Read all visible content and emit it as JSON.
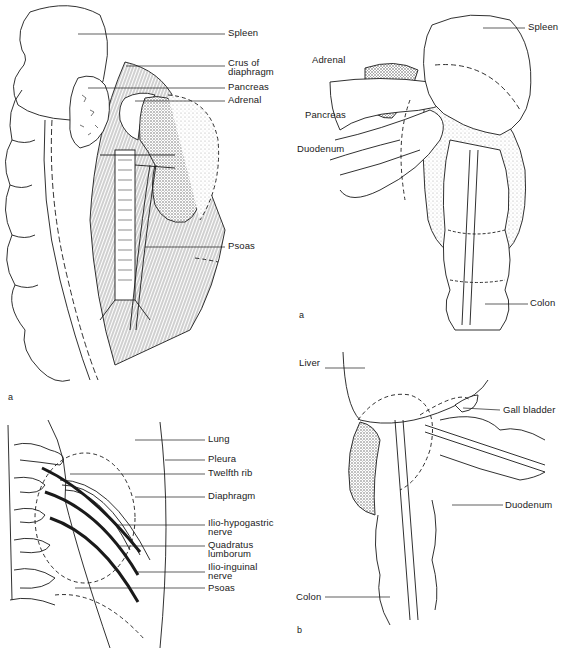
{
  "figure": {
    "panels": [
      {
        "id": "top-left",
        "panel_letter": "a",
        "subject": "Left kidney with posterior relations",
        "labels": [
          "Spleen",
          "Crus of diaphragm",
          "Pancreas",
          "Adrenal",
          "Psoas"
        ]
      },
      {
        "id": "top-right",
        "panel_letter": "a",
        "subject": "Left kidney anterior relations",
        "labels": [
          "Spleen",
          "Adrenal",
          "Pancreas",
          "Duodenum",
          "Colon"
        ]
      },
      {
        "id": "bottom-left",
        "panel_letter": "",
        "subject": "Posterior relations of kidney - ribs and nerves",
        "labels": [
          "Lung",
          "Pleura",
          "Twelfth rib",
          "Diaphragm",
          "Ilio-hypogastric nerve",
          "Quadratus lumborum",
          "Ilio-inguinal nerve",
          "Psoas"
        ]
      },
      {
        "id": "bottom-right",
        "panel_letter": "b",
        "subject": "Right kidney anterior relations",
        "labels": [
          "Liver",
          "Gall bladder",
          "Duodenum",
          "Colon"
        ]
      }
    ]
  },
  "tl": {
    "spleen": "Spleen",
    "crus_1": "Crus of",
    "crus_2": "diaphragm",
    "pancreas": "Pancreas",
    "adrenal": "Adrenal",
    "psoas": "Psoas",
    "letter": "a"
  },
  "tr": {
    "spleen": "Spleen",
    "adrenal": "Adrenal",
    "pancreas": "Pancreas",
    "duodenum": "Duodenum",
    "colon": "Colon",
    "letter": "a"
  },
  "bl": {
    "lung": "Lung",
    "pleura": "Pleura",
    "twelfth_rib": "Twelfth rib",
    "diaphragm": "Diaphragm",
    "ilio_hypo_1": "Ilio-hypogastric",
    "ilio_hypo_2": "nerve",
    "quad_1": "Quadratus",
    "quad_2": "lumborum",
    "ilio_ing_1": "Ilio-inguinal",
    "ilio_ing_2": "nerve",
    "psoas": "Psoas"
  },
  "br": {
    "liver": "Liver",
    "gall_bladder": "Gall bladder",
    "duodenum": "Duodenum",
    "colon": "Colon",
    "letter": "b"
  },
  "colors": {
    "ink": "#1a1a1a",
    "stipple": "#bdbdbd",
    "background": "#ffffff"
  }
}
